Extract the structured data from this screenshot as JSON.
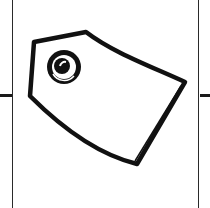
{
  "icon": {
    "name": "price-tag-icon",
    "stroke_color": "#111111",
    "fill_color": "#ffffff",
    "background_color": "#ffffff"
  }
}
